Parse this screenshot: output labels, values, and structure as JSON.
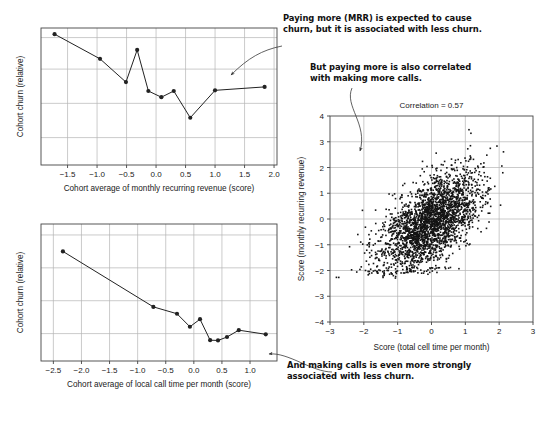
{
  "figure": {
    "background_color": "#ffffff",
    "ink_color": "#222222",
    "grid_color": "#b4b4b4",
    "axis_color": "#444444",
    "annotation_color": "#111111"
  },
  "annotations": [
    {
      "id": "annot-mrr-churn",
      "text": "Paying more (MRR) is expected to cause\nchurn, but it is associated with less churn.",
      "arrow_from": [
        282,
        46
      ],
      "arrow_to": [
        231,
        75
      ]
    },
    {
      "id": "annot-mrr-calls",
      "text": "But paying more is also correlated\nwith making more calls.",
      "arrow_from": [
        352,
        88
      ],
      "arrow_to": [
        360,
        153
      ]
    },
    {
      "id": "annot-calls-churn",
      "text": "And making calls is even more strongly\nassociated with less churn.",
      "arrow_from": [
        330,
        372
      ],
      "arrow_to": [
        268,
        354
      ]
    }
  ],
  "chart_data": [
    {
      "id": "chart-mrr-churn",
      "type": "line",
      "title": "",
      "xlabel": "Cohort average of monthly recurring revenue (score)",
      "ylabel": "Cohort churn (relative)",
      "xlim": [
        -1.95,
        2.05
      ],
      "ylim": [
        0,
        1
      ],
      "xticks": [
        -1.5,
        -1.0,
        -0.5,
        0.0,
        0.5,
        1.0,
        1.5,
        2.0
      ],
      "xtick_labels": [
        "-1.5",
        "-1.0",
        "-0.5",
        "0.0",
        "0.5",
        "1.0",
        "1.5",
        "2.0"
      ],
      "yticks": [
        0.2,
        0.45,
        0.7,
        0.93
      ],
      "ytick_labels": [
        "",
        "",
        "",
        ""
      ],
      "grid": true,
      "marker": "filled-circle",
      "x": [
        -1.72,
        -0.95,
        -0.51,
        -0.32,
        -0.13,
        0.09,
        0.3,
        0.58,
        1.0,
        1.84
      ],
      "y": [
        0.955,
        0.775,
        0.605,
        0.84,
        0.54,
        0.495,
        0.54,
        0.345,
        0.545,
        0.57
      ]
    },
    {
      "id": "chart-calls-churn",
      "type": "line",
      "title": "",
      "xlabel": "Cohort average of local call time per month (score)",
      "ylabel": "Cohort churn (relative)",
      "xlim": [
        -2.72,
        1.48
      ],
      "ylim": [
        0,
        1
      ],
      "xticks": [
        -2.5,
        -2.0,
        -1.5,
        -1.0,
        -0.5,
        0.0,
        0.5,
        1.0
      ],
      "xtick_labels": [
        "-2.5",
        "-2.0",
        "-1.5",
        "-1.0",
        "-0.5",
        "0.0",
        "0.5",
        "1.0"
      ],
      "yticks": [
        0.2,
        0.44,
        0.68,
        0.92
      ],
      "ytick_labels": [
        "",
        "",
        "",
        ""
      ],
      "grid": true,
      "marker": "filled-circle",
      "x": [
        -2.33,
        -0.72,
        -0.3,
        -0.07,
        0.11,
        0.29,
        0.43,
        0.59,
        0.8,
        1.28
      ],
      "y": [
        0.8,
        0.395,
        0.345,
        0.25,
        0.305,
        0.152,
        0.15,
        0.175,
        0.225,
        0.195
      ]
    },
    {
      "id": "chart-mrr-vs-calls-scatter",
      "type": "scatter",
      "title": "Correlation = 0.57",
      "xlabel": "Score (total cell time per month)",
      "ylabel": "Score (monthly recurring revenue)",
      "xlim": [
        -3,
        3
      ],
      "ylim": [
        -4,
        4
      ],
      "xticks": [
        -3,
        -2,
        -1,
        0,
        1,
        2,
        3
      ],
      "xtick_labels": [
        "-3",
        "-2",
        "-1",
        "0",
        "1",
        "2",
        "3"
      ],
      "yticks": [
        -4,
        -3,
        -2,
        -1,
        0,
        1,
        2,
        3,
        4
      ],
      "ytick_labels": [
        "-4",
        "-3",
        "-2",
        "-1",
        "0",
        "1",
        "2",
        "3",
        "4"
      ],
      "grid": true,
      "correlation": 0.57,
      "n_points": 2600,
      "marker": "small-filled-square",
      "distribution": {
        "kind": "bivariate-normal-skewed",
        "mean_x": -0.05,
        "mean_y": -0.15,
        "sd_x": 0.72,
        "sd_y": 0.95,
        "rho": 0.57,
        "floor_y": -2.0,
        "notes": "dense elongated cloud along positive diagonal with a flat shelf of points near y = -2"
      }
    }
  ]
}
